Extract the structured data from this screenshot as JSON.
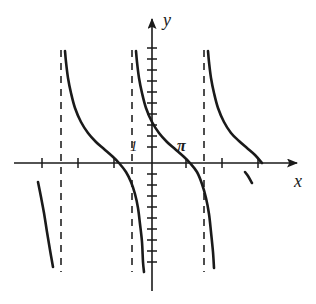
{
  "figure": {
    "title": "",
    "background_color": "#ffffff",
    "width": 316,
    "height": 304
  },
  "axes": {
    "x_label": "x",
    "y_label": "y",
    "x_axis_color": "#1a1a1a",
    "y_axis_color": "#1a1a1a",
    "origin_px": {
      "x": 152,
      "y": 163
    },
    "unit_px": 18,
    "x_axis_line": {
      "x1": 14,
      "x2": 303,
      "y": 163
    },
    "y_axis_line": {
      "x": 152,
      "y1": 13,
      "y2": 291
    }
  },
  "labels": {
    "one": "1",
    "pi": "π"
  },
  "chart_data": {
    "type": "line",
    "title": "",
    "xlabel": "x",
    "ylabel": "y",
    "function": "y = cot(x)",
    "grid": false,
    "legend": false,
    "xlim": [
      -7.7,
      8.4
    ],
    "ylim": [
      -7.1,
      8.3
    ],
    "period": 3.141592653589793,
    "x_tick_values": [
      -6.283185307,
      -4.71238898,
      -3.141592653,
      -1.570796327,
      1.570796327,
      2.879793266,
      3.926990817,
      5.497787144
    ],
    "y_tick_spacing": 0.611,
    "annotations": [
      {
        "text": "1",
        "x": -0.62,
        "y": 1.0,
        "role": "y-intercept-value"
      },
      {
        "text": "π",
        "x": 1.72,
        "y": 0.95,
        "role": "x-axis-period-marker"
      }
    ],
    "asymptotes": [
      {
        "x": -3.141592653,
        "style": "dashed",
        "px_x": 61
      },
      {
        "x": -1.130973355,
        "style": "dashed",
        "px_x": 132
      },
      {
        "x": 2.879793266,
        "style": "dashed",
        "px_x": 204
      }
    ],
    "branches": [
      {
        "name": "branch-far-left-partial",
        "points_px": [
          [
            38,
            182
          ],
          [
            41,
            197
          ],
          [
            44,
            213
          ],
          [
            47,
            232
          ],
          [
            50,
            250
          ],
          [
            53,
            267
          ]
        ]
      },
      {
        "name": "branch-left",
        "points_px": [
          [
            65,
            51
          ],
          [
            66,
            62
          ],
          [
            68,
            78
          ],
          [
            71,
            93
          ],
          [
            75,
            108
          ],
          [
            81,
            122
          ],
          [
            88,
            133
          ],
          [
            96,
            142
          ],
          [
            104,
            149
          ],
          [
            112,
            156
          ],
          [
            119,
            163
          ],
          [
            126,
            172
          ],
          [
            131,
            182
          ],
          [
            135,
            194
          ],
          [
            138,
            208
          ],
          [
            140,
            224
          ],
          [
            142,
            242
          ],
          [
            143,
            262
          ],
          [
            144,
            272
          ]
        ]
      },
      {
        "name": "branch-center",
        "points_px": [
          [
            136,
            51
          ],
          [
            137,
            62
          ],
          [
            139,
            78
          ],
          [
            142,
            93
          ],
          [
            146,
            108
          ],
          [
            152,
            122
          ],
          [
            159,
            133
          ],
          [
            167,
            142
          ],
          [
            175,
            149
          ],
          [
            183,
            156
          ],
          [
            190,
            163
          ],
          [
            197,
            172
          ],
          [
            202,
            184
          ],
          [
            206,
            198
          ],
          [
            209,
            214
          ],
          [
            211,
            232
          ],
          [
            213,
            252
          ],
          [
            214,
            268
          ]
        ]
      },
      {
        "name": "branch-right",
        "points_px": [
          [
            208,
            51
          ],
          [
            209,
            62
          ],
          [
            211,
            78
          ],
          [
            214,
            93
          ],
          [
            218,
            108
          ],
          [
            224,
            122
          ],
          [
            231,
            133
          ],
          [
            239,
            141
          ],
          [
            247,
            148
          ],
          [
            255,
            155
          ],
          [
            262,
            163
          ],
          [
            245,
            172
          ],
          [
            248,
            176
          ],
          [
            252,
            183
          ]
        ]
      }
    ],
    "x_ticks_px": [
      42,
      78,
      114,
      186,
      222,
      258
    ],
    "y_ticks_px_upper": [
      48,
      59,
      70,
      81,
      92,
      103,
      114,
      125,
      136,
      147
    ],
    "y_ticks_px_lower": [
      174,
      185,
      196,
      207,
      218,
      229,
      240,
      251,
      262
    ]
  },
  "style": {
    "curve_color": "#1a1a1a",
    "curve_width": 2.6,
    "asymptote_color": "#4d4d4d",
    "asymptote_width": 2.0,
    "asymptote_dash": "7 6",
    "axis_width": 1.6,
    "tick_width": 1.5,
    "tick_half_length": 5
  }
}
